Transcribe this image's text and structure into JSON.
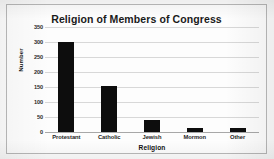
{
  "chart_data": {
    "type": "bar",
    "title": "Religion of Members of Congress",
    "xlabel": "Religion",
    "ylabel": "Number",
    "categories": [
      "Protestant",
      "Catholic",
      "Jewish",
      "Mormon",
      "Other"
    ],
    "values": [
      300,
      155,
      39,
      13,
      12
    ],
    "ylim": [
      0,
      350
    ],
    "yticks": [
      0,
      50,
      100,
      150,
      200,
      250,
      300,
      350
    ],
    "ytick_labels": [
      "0",
      "50",
      "100",
      "150",
      "200",
      "250",
      "300",
      "350"
    ],
    "grid": true,
    "legend": false,
    "legend_position": "none",
    "bar_color": "#0d0d0d",
    "gridline_color": "#d8d8d8",
    "background_color": "#fdfdfd",
    "frame_color": "#b9b9b9"
  }
}
